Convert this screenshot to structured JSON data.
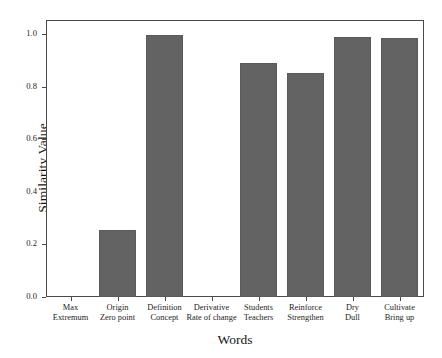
{
  "chart_data": {
    "type": "bar",
    "title": "",
    "xlabel": "Words",
    "ylabel": "Similarity Value",
    "ylim": [
      0.0,
      1.05
    ],
    "ytick_labels": [
      "0.0",
      "0.2",
      "0.4",
      "0.6",
      "0.8",
      "1.0"
    ],
    "ytick_values": [
      0.0,
      0.2,
      0.4,
      0.6,
      0.8,
      1.0
    ],
    "grid": false,
    "legend": null,
    "bar_color": "#636363",
    "categories": [
      "Max Extremum",
      "Origin Zero point",
      "Definition Concept",
      "Derivative Rate of change",
      "Students Teachers",
      "Reinforce Strengthen",
      "Dry Dull",
      "Cultivate Bring up"
    ],
    "category_lines": [
      {
        "line1": "Max",
        "line2": "Extremum"
      },
      {
        "line1": "Origin",
        "line2": "Zero point"
      },
      {
        "line1": "Definition",
        "line2": "Concept"
      },
      {
        "line1": "Derivative",
        "line2": "Rate of change"
      },
      {
        "line1": "Students",
        "line2": "Teachers"
      },
      {
        "line1": "Reinforce",
        "line2": "Strengthen"
      },
      {
        "line1": "Dry",
        "line2": "Dull"
      },
      {
        "line1": "Cultivate",
        "line2": "Bring up"
      }
    ],
    "values": [
      0.0,
      0.255,
      0.998,
      0.0,
      0.89,
      0.853,
      0.99,
      0.987
    ]
  }
}
